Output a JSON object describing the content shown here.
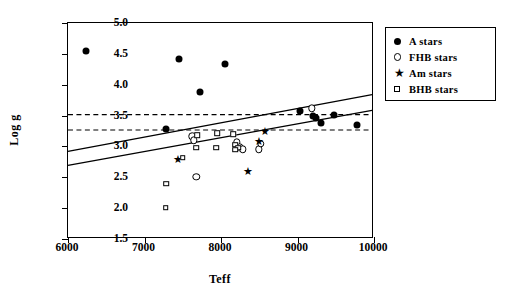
{
  "chart_data": {
    "type": "scatter",
    "title": "",
    "xlabel": "Teff",
    "ylabel": "Log g",
    "xlim": [
      6000,
      10000
    ],
    "ylim": [
      1.5,
      5.0
    ],
    "xticks": [
      6000,
      7000,
      8000,
      9000,
      10000
    ],
    "yticks": [
      1.5,
      2.0,
      2.5,
      3.0,
      3.5,
      4.0,
      4.5,
      5.0
    ],
    "xtick_labels": [
      "6000",
      "7000",
      "8000",
      "9000",
      "10000"
    ],
    "ytick_labels": [
      "1.5",
      "2.0",
      "2.5",
      "3.0",
      "3.5",
      "4.0",
      "4.5",
      "5.0"
    ],
    "grid": false,
    "legend_position": "outside-top-right",
    "series": [
      {
        "name": "A stars",
        "marker": "filled-circle",
        "color": "#000000",
        "points": [
          [
            6250,
            4.53
          ],
          [
            7460,
            4.4
          ],
          [
            8060,
            4.32
          ],
          [
            7740,
            3.87
          ],
          [
            7300,
            3.26
          ],
          [
            9050,
            3.55
          ],
          [
            9210,
            3.48
          ],
          [
            9250,
            3.44
          ],
          [
            9320,
            3.37
          ],
          [
            9490,
            3.5
          ],
          [
            9790,
            3.33
          ]
        ]
      },
      {
        "name": "FHB stars",
        "marker": "open-circle",
        "color": "#000000",
        "points": [
          [
            7640,
            3.15
          ],
          [
            7660,
            3.08
          ],
          [
            8220,
            3.05
          ],
          [
            8260,
            2.97
          ],
          [
            8300,
            2.94
          ],
          [
            8510,
            2.94
          ],
          [
            8530,
            3.03
          ],
          [
            7690,
            2.49
          ],
          [
            9200,
            3.6
          ]
        ]
      },
      {
        "name": "Am stars",
        "marker": "star",
        "color": "#000000",
        "points": [
          [
            7450,
            2.78
          ],
          [
            8370,
            2.58
          ],
          [
            8510,
            3.07
          ],
          [
            8590,
            3.24
          ]
        ]
      },
      {
        "name": "BHB stars",
        "marker": "open-square",
        "color": "#000000",
        "points": [
          [
            7510,
            2.8
          ],
          [
            7700,
            3.17
          ],
          [
            7690,
            2.96
          ],
          [
            7960,
            3.2
          ],
          [
            7950,
            2.96
          ],
          [
            8170,
            3.18
          ],
          [
            8200,
            3.01
          ],
          [
            8240,
            2.96
          ],
          [
            8200,
            2.93
          ],
          [
            7300,
            2.38
          ],
          [
            7290,
            1.99
          ]
        ]
      }
    ],
    "reference_lines": [
      {
        "name": "upper-dashed-line",
        "style": "dashed",
        "orientation": "horizontal",
        "y": 3.5
      },
      {
        "name": "lower-dashed-line",
        "style": "dashed",
        "orientation": "horizontal",
        "y": 3.25
      },
      {
        "name": "upper-trend-line",
        "style": "solid",
        "x0": 6000,
        "y0": 2.9,
        "x1": 10000,
        "y1": 3.83
      },
      {
        "name": "lower-trend-line",
        "style": "solid",
        "x0": 6000,
        "y0": 2.67,
        "x1": 10000,
        "y1": 3.57
      }
    ]
  },
  "legend": {
    "entries": [
      {
        "label": "A stars",
        "marker": "filled-circle"
      },
      {
        "label": "FHB stars",
        "marker": "open-circle"
      },
      {
        "label": "Am stars",
        "marker": "star"
      },
      {
        "label": "BHB stars",
        "marker": "open-square"
      }
    ]
  }
}
